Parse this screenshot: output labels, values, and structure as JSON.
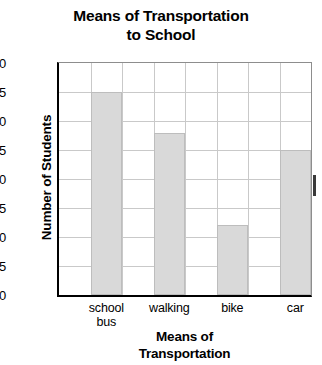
{
  "chart_data": {
    "type": "bar",
    "title": "Means of Transportation to School",
    "title_lines": [
      "Means of Transportation",
      "to School"
    ],
    "xlabel": "Means of Transportation",
    "xlabel_lines": [
      "Means of",
      "Transportation"
    ],
    "ylabel": "Number of Students",
    "categories": [
      "school bus",
      "walking",
      "bike",
      "car"
    ],
    "category_lines": [
      [
        "school",
        "bus"
      ],
      [
        "walking"
      ],
      [
        "bike"
      ],
      [
        "car"
      ]
    ],
    "values": [
      35,
      28,
      12,
      25
    ],
    "ylim": [
      0,
      40
    ],
    "ytick_step": 5,
    "yticks": [
      0,
      5,
      10,
      15,
      20,
      25,
      30,
      35,
      40
    ],
    "ytick_labels": [
      "0",
      "5",
      "10",
      "15",
      "20",
      "25",
      "30",
      "35",
      "40"
    ],
    "grid": true,
    "legend": "none",
    "bar_color": "#d9d9d9",
    "bar_border_color": "#bdbdbd",
    "grid_color": "#c9c9c9",
    "axis_color": "#000000",
    "background_color": "#ffffff"
  }
}
